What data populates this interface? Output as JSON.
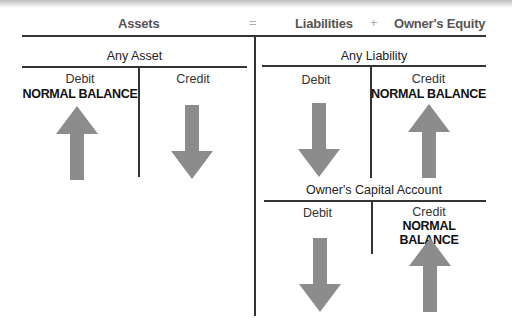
{
  "equation": {
    "assets": "Assets",
    "equals": "=",
    "liabilities": "Liabilities",
    "plus": "+",
    "equity": "Owner's Equity"
  },
  "accounts": [
    {
      "title": "Any Asset",
      "debit": "Debit",
      "credit": "Credit",
      "normal_side": "debit",
      "normal_label": "NORMAL BALANCE",
      "debit_arrow": "up-arrow-icon",
      "credit_arrow": "down-arrow-icon"
    },
    {
      "title": "Any Liability",
      "debit": "Debit",
      "credit": "Credit",
      "normal_side": "credit",
      "normal_label": "NORMAL BALANCE",
      "debit_arrow": "down-arrow-icon",
      "credit_arrow": "up-arrow-icon"
    },
    {
      "title": "Owner's Capital Account",
      "debit": "Debit",
      "credit": "Credit",
      "normal_side": "credit",
      "normal_label": "NORMAL BALANCE",
      "debit_arrow": "down-arrow-icon",
      "credit_arrow": "up-arrow-icon"
    }
  ],
  "colors": {
    "arrow": "#8c8c8c",
    "line": "#333333"
  }
}
